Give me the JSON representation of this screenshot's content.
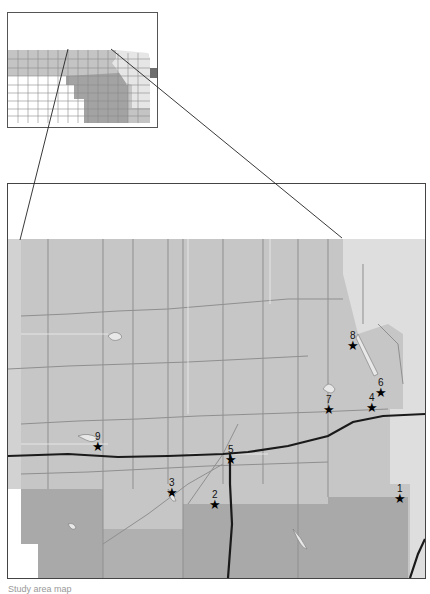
{
  "inset_map": {
    "colors": {
      "light": "#eeeeee",
      "mid": "#c4c4c4",
      "dark": "#a3a3a3",
      "darkest": "#6e6e6e",
      "white": "#ffffff"
    }
  },
  "main_map": {
    "colors": {
      "base": "#c6c6c6",
      "east_light": "#dcdcdc",
      "south_dark": "#a9a9a9",
      "county_line": "#8a8a8a",
      "road": "#1a1a1a",
      "water": "#e8e8e8"
    },
    "markers": [
      {
        "id": "1",
        "label": "1",
        "x": 400,
        "y": 498
      },
      {
        "id": "2",
        "label": "2",
        "x": 215,
        "y": 504
      },
      {
        "id": "3",
        "label": "3",
        "x": 172,
        "y": 492
      },
      {
        "id": "4",
        "label": "4",
        "x": 372,
        "y": 407
      },
      {
        "id": "5",
        "label": "5",
        "x": 231,
        "y": 459
      },
      {
        "id": "6",
        "label": "6",
        "x": 381,
        "y": 392
      },
      {
        "id": "7",
        "label": "7",
        "x": 329,
        "y": 409
      },
      {
        "id": "8",
        "label": "8",
        "x": 353,
        "y": 345
      },
      {
        "id": "9",
        "label": "9",
        "x": 98,
        "y": 446
      }
    ]
  },
  "caption": "Study area map"
}
